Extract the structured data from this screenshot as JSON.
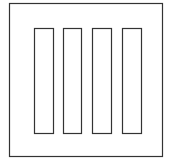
{
  "diagram": {
    "bar_count": 4,
    "stroke_color": "#333333",
    "background_color": "#ffffff"
  }
}
